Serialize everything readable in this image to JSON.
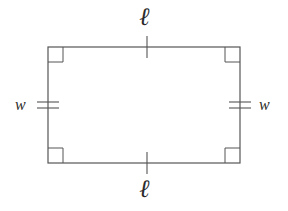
{
  "figure": {
    "type": "geometry-diagram",
    "shape": "rectangle",
    "stroke_color": "#555555",
    "marker_color": "#555555",
    "background_color": "#ffffff",
    "text_color": "#2b2b2b",
    "rectangle": {
      "x": 48,
      "y": 47,
      "width": 192,
      "height": 116,
      "stroke_width": 1.2
    },
    "corner_markers": {
      "count": 4,
      "size": 15,
      "style": "square",
      "meaning": "right-angle"
    },
    "tick_marks": {
      "top": 1,
      "bottom": 1,
      "left": 2,
      "right": 2
    },
    "labels": {
      "length_top": "ℓ",
      "length_bottom": "ℓ",
      "width_left": "w",
      "width_right": "w"
    }
  }
}
